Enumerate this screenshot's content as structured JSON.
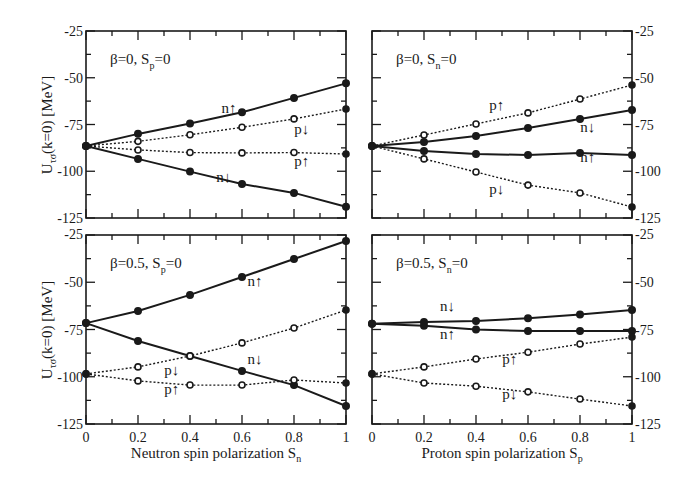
{
  "figure": {
    "ylabel": "U",
    "ylabel_sub": "τσ",
    "ylabel_rest": "(k=0) [MeV]",
    "yticks": [
      "-25",
      "-50",
      "-75",
      "-100",
      "-125"
    ],
    "xticks": [
      "0",
      "0.2",
      "0.4",
      "0.6",
      "0.8",
      "1"
    ],
    "xlabel_left": "Neutron spin polarization S",
    "xlabel_left_sub": "n",
    "xlabel_right": "Proton spin polarization S",
    "xlabel_right_sub": "p"
  },
  "chart_data": [
    {
      "type": "line",
      "panel": "top-left",
      "title": "β=0, Sp=0",
      "xlabel": "Neutron spin polarization Sn",
      "ylabel": "Uτσ(k=0) [MeV]",
      "ylim": [
        -125,
        -25
      ],
      "xlim": [
        0,
        1
      ],
      "x": [
        0,
        0.2,
        0.4,
        0.6,
        0.8,
        1
      ],
      "series": [
        {
          "name": "n↑",
          "style": "solid",
          "values": [
            -86.5,
            -80.0,
            -74.5,
            -68.5,
            -60.8,
            -53.0
          ]
        },
        {
          "name": "p↓",
          "style": "dotted",
          "values": [
            -86.5,
            -84.0,
            -80.5,
            -76.5,
            -72.0,
            -66.7
          ]
        },
        {
          "name": "p↑",
          "style": "dotted",
          "values": [
            -86.5,
            -88.6,
            -90.0,
            -90.2,
            -90.0,
            -90.8
          ]
        },
        {
          "name": "n↓",
          "style": "solid",
          "values": [
            -86.5,
            -93.4,
            -100.2,
            -106.8,
            -111.6,
            -119.0
          ]
        }
      ]
    },
    {
      "type": "line",
      "panel": "top-right",
      "title": "β=0, Sn=0",
      "xlabel": "Proton spin polarization Sp",
      "ylabel": "Uτσ(k=0) [MeV]",
      "ylim": [
        -125,
        -25
      ],
      "xlim": [
        0,
        1
      ],
      "x": [
        0,
        0.2,
        0.4,
        0.6,
        0.8,
        1
      ],
      "series": [
        {
          "name": "p↑",
          "style": "dotted",
          "values": [
            -86.5,
            -80.6,
            -74.7,
            -68.8,
            -61.4,
            -53.9
          ]
        },
        {
          "name": "n↓",
          "style": "solid",
          "values": [
            -86.5,
            -84.4,
            -81.1,
            -76.9,
            -72.0,
            -67.2
          ]
        },
        {
          "name": "n↑",
          "style": "solid",
          "values": [
            -86.5,
            -89.2,
            -90.8,
            -91.3,
            -90.2,
            -91.3
          ]
        },
        {
          "name": "p↓",
          "style": "dotted",
          "values": [
            -86.5,
            -93.4,
            -100.4,
            -107.4,
            -111.6,
            -119.1
          ]
        }
      ]
    },
    {
      "type": "line",
      "panel": "bottom-left",
      "title": "β=0.5, Sp=0",
      "xlabel": "Neutron spin polarization Sn",
      "ylabel": "Uτσ(k=0) [MeV]",
      "ylim": [
        -125,
        -25
      ],
      "xlim": [
        0,
        1
      ],
      "x": [
        0,
        0.2,
        0.4,
        0.6,
        0.8,
        1
      ],
      "series": [
        {
          "name": "n↑",
          "style": "solid",
          "values": [
            -71.6,
            -65.2,
            -56.7,
            -47.2,
            -37.7,
            -28.2
          ]
        },
        {
          "name": "n↓",
          "style": "solid",
          "values": [
            -71.6,
            -81.1,
            -89.0,
            -96.9,
            -104.4,
            -115.5
          ]
        },
        {
          "name": "p↓",
          "style": "dotted",
          "values": [
            -98.5,
            -94.8,
            -89.0,
            -82.1,
            -74.2,
            -64.7
          ]
        },
        {
          "name": "p↑",
          "style": "dotted",
          "values": [
            -98.5,
            -102.2,
            -104.4,
            -104.4,
            -101.7,
            -103.3
          ]
        }
      ]
    },
    {
      "type": "line",
      "panel": "bottom-right",
      "title": "β=0.5, Sn=0",
      "xlabel": "Proton spin polarization Sp",
      "ylabel": "Uτσ(k=0) [MeV]",
      "ylim": [
        -125,
        -25
      ],
      "xlim": [
        0,
        1
      ],
      "x": [
        0,
        0.2,
        0.4,
        0.6,
        0.8,
        1
      ],
      "series": [
        {
          "name": "n↓",
          "style": "solid",
          "values": [
            -72.0,
            -71.0,
            -70.5,
            -69.0,
            -67.0,
            -64.7
          ]
        },
        {
          "name": "n↑",
          "style": "solid",
          "values": [
            -72.0,
            -73.0,
            -75.0,
            -75.8,
            -75.8,
            -75.8
          ]
        },
        {
          "name": "p↑",
          "style": "dotted",
          "values": [
            -98.5,
            -94.8,
            -90.6,
            -87.0,
            -82.7,
            -79.0
          ]
        },
        {
          "name": "p↓",
          "style": "dotted",
          "values": [
            -98.5,
            -103.3,
            -105.0,
            -108.0,
            -111.8,
            -115.5
          ]
        }
      ]
    }
  ],
  "panels": [
    {
      "id": "top-left",
      "label_main": "β=0, S",
      "label_sub": "p",
      "label_end": "=0",
      "series_labels": [
        {
          "text": "n↑",
          "x": 0.55,
          "y": -69
        },
        {
          "text": "p↓",
          "x": 0.83,
          "y": -80
        },
        {
          "text": "p↑",
          "x": 0.83,
          "y": -97
        },
        {
          "text": "n↓",
          "x": 0.53,
          "y": -106
        }
      ]
    },
    {
      "id": "top-right",
      "label_main": "β=0, S",
      "label_sub": "n",
      "label_end": "=0",
      "series_labels": [
        {
          "text": "p↑",
          "x": 0.48,
          "y": -67
        },
        {
          "text": "n↓",
          "x": 0.83,
          "y": -79
        },
        {
          "text": "n↑",
          "x": 0.83,
          "y": -95
        },
        {
          "text": "p↓",
          "x": 0.48,
          "y": -112
        }
      ]
    },
    {
      "id": "bottom-left",
      "label_main": "β=0.5, S",
      "label_sub": "p",
      "label_end": "=0",
      "series_labels": [
        {
          "text": "n↑",
          "x": 0.65,
          "y": -52
        },
        {
          "text": "n↓",
          "x": 0.65,
          "y": -93
        },
        {
          "text": "p↓",
          "x": 0.33,
          "y": -99
        },
        {
          "text": "p↑",
          "x": 0.33,
          "y": -109
        }
      ]
    },
    {
      "id": "bottom-right",
      "label_main": "β=0.5, S",
      "label_sub": "n",
      "label_end": "=0",
      "series_labels": [
        {
          "text": "n↓",
          "x": 0.29,
          "y": -65
        },
        {
          "text": "n↑",
          "x": 0.29,
          "y": -80
        },
        {
          "text": "p↑",
          "x": 0.53,
          "y": -93
        },
        {
          "text": "p↓",
          "x": 0.53,
          "y": -112
        }
      ]
    }
  ]
}
